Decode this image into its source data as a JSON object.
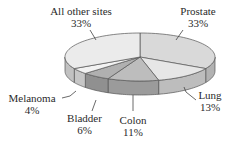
{
  "chart_data": {
    "type": "pie",
    "style": "3d",
    "title": "",
    "categories": [
      "Prostate",
      "Lung",
      "Colon",
      "Bladder",
      "Melanoma",
      "All other sites"
    ],
    "values": [
      33,
      13,
      11,
      6,
      4,
      33
    ],
    "unit": "%",
    "labels": [
      {
        "name": "Prostate",
        "pct": "33%"
      },
      {
        "name": "Lung",
        "pct": "13%"
      },
      {
        "name": "Colon",
        "pct": "11%"
      },
      {
        "name": "Bladder",
        "pct": "6%"
      },
      {
        "name": "Melanoma",
        "pct": "4%"
      },
      {
        "name": "All other sites",
        "pct": "33%"
      }
    ],
    "colors": [
      "#d9d9d9",
      "#e6e6e6",
      "#bdbdbd",
      "#b0b0b0",
      "#f2f2f2",
      "#ebebeb"
    ],
    "legend": "none (direct labels with leader lines)"
  }
}
